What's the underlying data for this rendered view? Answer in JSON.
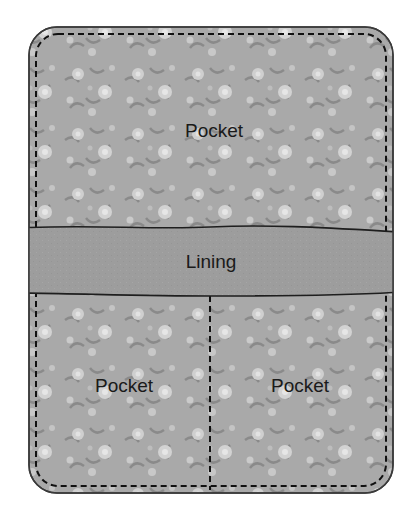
{
  "diagram": {
    "panels": [
      {
        "id": "top-pocket",
        "label": "Pocket"
      },
      {
        "id": "lining",
        "label": "Lining"
      },
      {
        "id": "bottom-left-pocket",
        "label": "Pocket"
      },
      {
        "id": "bottom-right-pocket",
        "label": "Pocket"
      }
    ],
    "colors": {
      "fabric_base": "#a9a9a9",
      "fabric_flower": "#d6d6d6",
      "fabric_leaf": "#8e8e8e",
      "lining": "#9c9c9c",
      "outline": "#3a3a3a",
      "stitch": "#111111"
    }
  }
}
